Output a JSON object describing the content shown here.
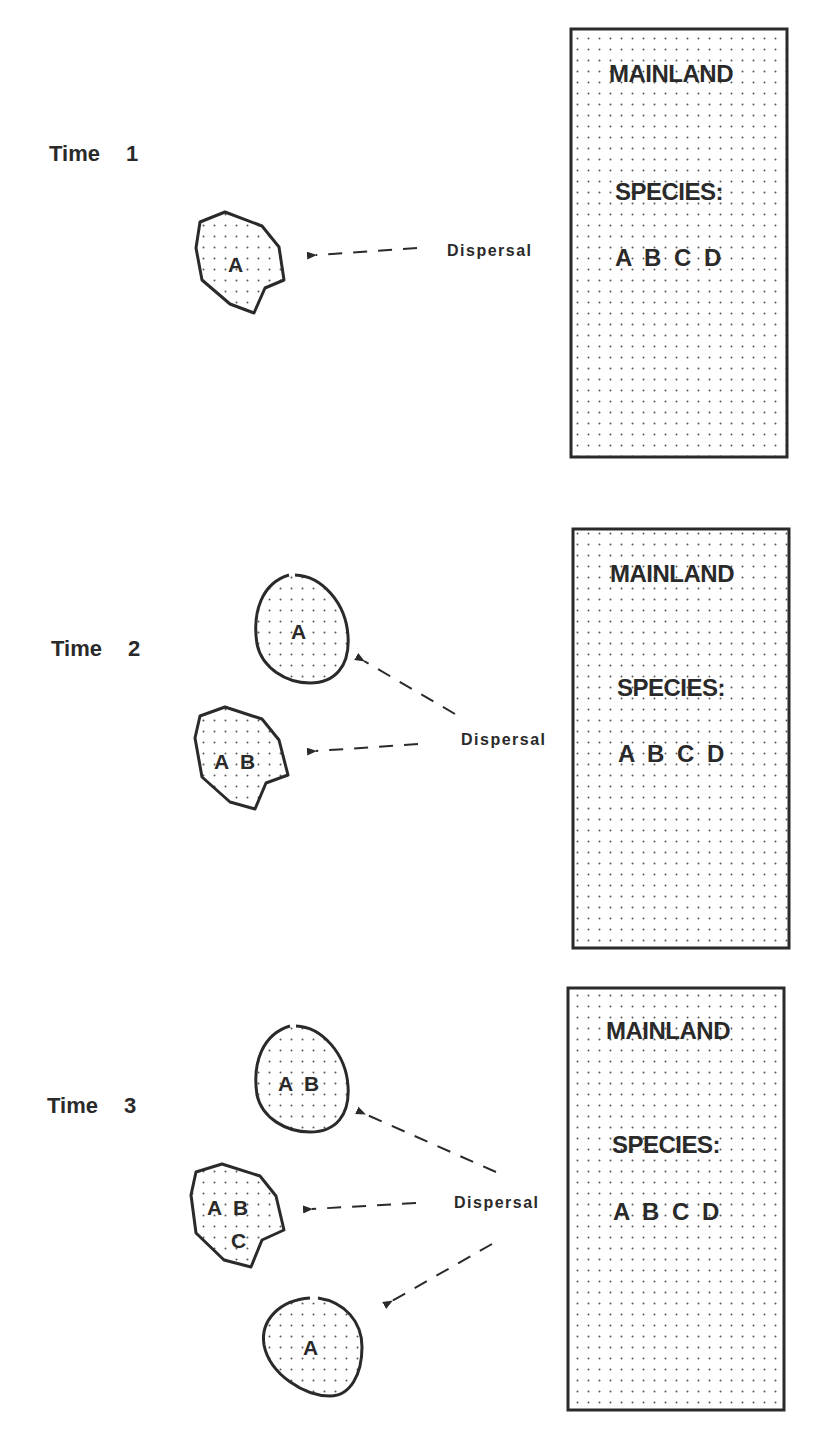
{
  "panels": [
    {
      "time_label": "Time",
      "time_number": "1",
      "mainland": {
        "title": "MAINLAND",
        "species_heading": "SPECIES:",
        "species": "A B C D"
      },
      "dispersal_label": "Dispersal",
      "islands": [
        {
          "species": "A"
        }
      ]
    },
    {
      "time_label": "Time",
      "time_number": "2",
      "mainland": {
        "title": "MAINLAND",
        "species_heading": "SPECIES:",
        "species": "A B C D"
      },
      "dispersal_label": "Dispersal",
      "islands": [
        {
          "species": "A"
        },
        {
          "species": "A  B"
        }
      ]
    },
    {
      "time_label": "Time",
      "time_number": "3",
      "mainland": {
        "title": "MAINLAND",
        "species_heading": "SPECIES:",
        "species": "A B C D"
      },
      "dispersal_label": "Dispersal",
      "islands": [
        {
          "species": "A  B"
        },
        {
          "species_line1": "A  B",
          "species_line2": "C"
        },
        {
          "species": "A"
        }
      ]
    }
  ],
  "colors": {
    "ink": "#2a2a2a",
    "dot": "#555555",
    "background": "#ffffff"
  }
}
